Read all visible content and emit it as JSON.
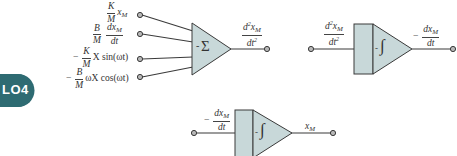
{
  "badge": {
    "label": "LO4",
    "color": "#2e6b72"
  },
  "colors": {
    "block_fill": "#c8d8d9",
    "block_stroke": "#3a3a3a",
    "wire": "#3a3a3a",
    "terminal_fill": "#b8b8b8"
  },
  "summer": {
    "symbol": "Σ",
    "sign": "-",
    "inputs": [
      {
        "coef_num": "K",
        "coef_den": "M",
        "term": "x",
        "term_sub": "M"
      },
      {
        "coef_num": "B",
        "coef_den": "M",
        "term_num": "dx",
        "term_num_sub": "M",
        "term_den": "dt"
      },
      {
        "sign": "−",
        "coef_num": "K",
        "coef_den": "M",
        "term": "X sin(ωt)"
      },
      {
        "sign": "−",
        "coef_num": "B",
        "coef_den": "M",
        "term": "ωX cos(ωt)"
      }
    ],
    "output": {
      "num": "d",
      "num_sup": "2",
      "num_var": "x",
      "num_sub": "M",
      "den": "dt",
      "den_sup": "2"
    }
  },
  "integrator1": {
    "symbol": "∫",
    "sign": "-",
    "input": {
      "num": "d",
      "num_sup": "2",
      "num_var": "x",
      "num_sub": "M",
      "den": "dt",
      "den_sup": "2"
    },
    "output": {
      "sign": "−",
      "num": "dx",
      "num_sub": "M",
      "den": "dt"
    }
  },
  "integrator2": {
    "symbol": "∫",
    "sign": "-",
    "input": {
      "sign": "−",
      "num": "dx",
      "num_sub": "M",
      "den": "dt"
    },
    "output": {
      "var": "x",
      "sub": "M"
    }
  }
}
